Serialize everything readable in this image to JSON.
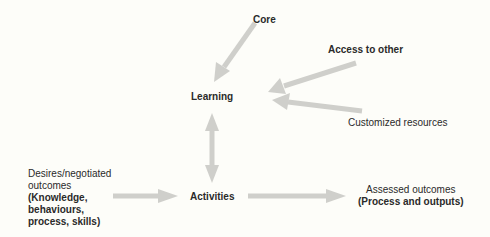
{
  "diagram": {
    "nodes": {
      "core": "Core",
      "access": "Access to other",
      "learning": "Learning",
      "customized": "Customized resources",
      "desires_line1": "Desires/negotiated",
      "desires_line2": "outcomes",
      "desires_bold1": "(Knowledge,",
      "desires_bold2": "behaviours,",
      "desires_bold3": "process, skills)",
      "activities": "Activities",
      "assessed_line1": "Assessed outcomes",
      "assessed_bold": "(Process and outputs)"
    },
    "colors": {
      "background": "#fdfdf9",
      "arrow": "#cfcfcb",
      "text": "#2a2a2a"
    },
    "edges": [
      {
        "from": "Core",
        "to": "Learning"
      },
      {
        "from": "Access to other",
        "to": "Learning"
      },
      {
        "from": "Customized resources",
        "to": "Learning"
      },
      {
        "from": "Learning",
        "to": "Activities",
        "bidirectional": true
      },
      {
        "from": "Desires/negotiated outcomes",
        "to": "Activities"
      },
      {
        "from": "Activities",
        "to": "Assessed outcomes"
      }
    ]
  }
}
